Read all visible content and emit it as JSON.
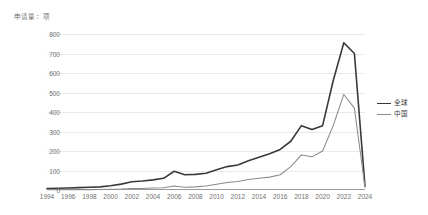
{
  "chart_data": {
    "type": "line",
    "title": "申请量：项",
    "xlabel": "",
    "ylabel": "申请量：项",
    "ylim": [
      0,
      800
    ],
    "y_ticks": [
      0,
      100,
      200,
      300,
      400,
      500,
      600,
      700,
      800
    ],
    "x_ticks": [
      "1994",
      "1996",
      "1998",
      "2000",
      "2002",
      "2004",
      "2006",
      "2008",
      "2010",
      "2012",
      "2014",
      "2016",
      "2018",
      "2020",
      "2022",
      "2024"
    ],
    "grid": true,
    "legend_position": "right",
    "x": [
      1994,
      1995,
      1996,
      1997,
      1998,
      1999,
      2000,
      2001,
      2002,
      2003,
      2004,
      2005,
      2006,
      2007,
      2008,
      2009,
      2010,
      2011,
      2012,
      2013,
      2014,
      2015,
      2016,
      2017,
      2018,
      2019,
      2020,
      2021,
      2022,
      2023,
      2024
    ],
    "series": [
      {
        "name": "全球",
        "color": "#3a3a3a",
        "values": [
          8,
          9,
          10,
          12,
          14,
          16,
          22,
          30,
          42,
          46,
          52,
          60,
          96,
          78,
          80,
          86,
          104,
          120,
          128,
          150,
          168,
          186,
          208,
          250,
          330,
          310,
          330,
          560,
          755,
          700,
          20
        ]
      },
      {
        "name": "中国",
        "color": "#8a8a8a",
        "values": [
          1,
          1,
          1,
          2,
          2,
          3,
          4,
          5,
          8,
          8,
          10,
          12,
          20,
          14,
          16,
          20,
          30,
          38,
          44,
          54,
          60,
          66,
          78,
          120,
          180,
          170,
          200,
          330,
          490,
          420,
          14
        ]
      }
    ]
  },
  "legend": {
    "items": [
      {
        "label": "全球",
        "color": "#3a3a3a",
        "width": "1.6px"
      },
      {
        "label": "中国",
        "color": "#8a8a8a",
        "width": "1.1px"
      }
    ]
  }
}
